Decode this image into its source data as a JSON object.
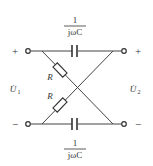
{
  "diagram": {
    "type": "lattice two-port network",
    "ports": {
      "left": {
        "plus": "+",
        "minus": "−",
        "voltage": "U̇",
        "voltage_sub": "1"
      },
      "right": {
        "plus": "+",
        "minus": "−",
        "voltage": "U̇",
        "voltage_sub": "2"
      }
    },
    "top_capacitor": {
      "numerator": "1",
      "denominator": "jωC"
    },
    "bottom_capacitor": {
      "numerator": "1",
      "denominator": "jωC"
    },
    "resistors": [
      {
        "label": "R"
      },
      {
        "label": "R"
      }
    ],
    "colors": {
      "line": "#444444",
      "background": "#ffffff"
    }
  }
}
